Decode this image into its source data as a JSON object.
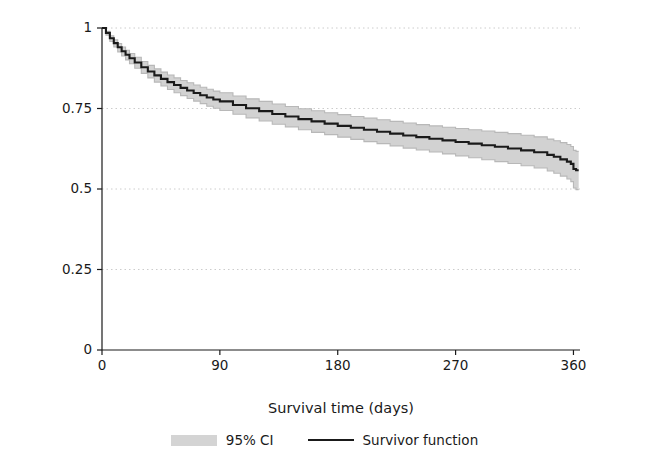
{
  "chart_data": {
    "type": "line",
    "title": "",
    "xlabel": "Survival time (days)",
    "ylabel": "Cumulative survival",
    "xlim": [
      0,
      365
    ],
    "ylim": [
      0,
      1
    ],
    "xticks": [
      0,
      90,
      180,
      270,
      360
    ],
    "yticks": [
      0,
      0.25,
      0.5,
      0.75,
      1
    ],
    "ytick_labels": [
      "0",
      "0.25",
      "0.5",
      "0.75",
      "1"
    ],
    "xtick_labels": [
      "0",
      "90",
      "180",
      "270",
      "360"
    ],
    "grid": "horizontal-dotted",
    "legend_position": "bottom-center",
    "legend": [
      {
        "label": "95% CI",
        "style": "band",
        "color": "#d4d4d4"
      },
      {
        "label": "Survivor function",
        "style": "line",
        "color": "#1a1a1a"
      }
    ],
    "series": [
      {
        "name": "Survivor function",
        "color": "#1a1a1a",
        "x": [
          0,
          3,
          6,
          9,
          12,
          15,
          18,
          21,
          25,
          30,
          35,
          40,
          45,
          50,
          55,
          60,
          65,
          70,
          75,
          80,
          85,
          90,
          100,
          110,
          120,
          130,
          140,
          150,
          160,
          170,
          180,
          190,
          200,
          210,
          220,
          230,
          240,
          250,
          260,
          270,
          280,
          290,
          300,
          310,
          320,
          330,
          340,
          345,
          350,
          355,
          358,
          360,
          362,
          364
        ],
        "y": [
          1.0,
          0.985,
          0.968,
          0.953,
          0.94,
          0.928,
          0.917,
          0.906,
          0.893,
          0.878,
          0.865,
          0.853,
          0.842,
          0.832,
          0.823,
          0.814,
          0.806,
          0.798,
          0.791,
          0.784,
          0.778,
          0.772,
          0.761,
          0.751,
          0.742,
          0.733,
          0.725,
          0.717,
          0.71,
          0.703,
          0.696,
          0.69,
          0.684,
          0.678,
          0.672,
          0.666,
          0.661,
          0.656,
          0.651,
          0.646,
          0.641,
          0.636,
          0.631,
          0.626,
          0.62,
          0.614,
          0.606,
          0.6,
          0.592,
          0.585,
          0.578,
          0.562,
          0.558,
          0.558
        ]
      },
      {
        "name": "95% CI upper",
        "color": "#c9c9c9",
        "x": [
          0,
          3,
          6,
          9,
          12,
          15,
          18,
          21,
          25,
          30,
          35,
          40,
          45,
          50,
          55,
          60,
          65,
          70,
          75,
          80,
          85,
          90,
          100,
          110,
          120,
          130,
          140,
          150,
          160,
          170,
          180,
          190,
          200,
          210,
          220,
          230,
          240,
          250,
          260,
          270,
          280,
          290,
          300,
          310,
          320,
          330,
          340,
          345,
          350,
          355,
          358,
          360,
          362,
          364
        ],
        "y": [
          1.0,
          0.99,
          0.976,
          0.963,
          0.952,
          0.941,
          0.931,
          0.921,
          0.909,
          0.896,
          0.884,
          0.873,
          0.863,
          0.854,
          0.845,
          0.837,
          0.83,
          0.823,
          0.816,
          0.81,
          0.804,
          0.799,
          0.789,
          0.78,
          0.772,
          0.764,
          0.756,
          0.749,
          0.743,
          0.737,
          0.731,
          0.725,
          0.72,
          0.715,
          0.71,
          0.705,
          0.7,
          0.696,
          0.692,
          0.688,
          0.684,
          0.68,
          0.676,
          0.672,
          0.667,
          0.662,
          0.655,
          0.65,
          0.644,
          0.638,
          0.632,
          0.62,
          0.617,
          0.617
        ]
      },
      {
        "name": "95% CI lower",
        "color": "#c9c9c9",
        "x": [
          0,
          3,
          6,
          9,
          12,
          15,
          18,
          21,
          25,
          30,
          35,
          40,
          45,
          50,
          55,
          60,
          65,
          70,
          75,
          80,
          85,
          90,
          100,
          110,
          120,
          130,
          140,
          150,
          160,
          170,
          180,
          190,
          200,
          210,
          220,
          230,
          240,
          250,
          260,
          270,
          280,
          290,
          300,
          310,
          320,
          330,
          340,
          345,
          350,
          355,
          358,
          360,
          362,
          364
        ],
        "y": [
          1.0,
          0.978,
          0.958,
          0.941,
          0.926,
          0.913,
          0.901,
          0.889,
          0.875,
          0.859,
          0.845,
          0.832,
          0.82,
          0.809,
          0.799,
          0.79,
          0.781,
          0.773,
          0.765,
          0.757,
          0.751,
          0.744,
          0.732,
          0.721,
          0.711,
          0.701,
          0.693,
          0.684,
          0.676,
          0.669,
          0.661,
          0.654,
          0.647,
          0.641,
          0.634,
          0.627,
          0.621,
          0.615,
          0.609,
          0.603,
          0.597,
          0.591,
          0.585,
          0.579,
          0.572,
          0.565,
          0.556,
          0.549,
          0.54,
          0.531,
          0.523,
          0.503,
          0.498,
          0.498
        ]
      }
    ]
  },
  "axes": {
    "y_title": "Cumulative survival",
    "x_title": "Survival time (days)"
  },
  "legend": {
    "ci_label": "95% CI",
    "survivor_label": "Survivor function"
  }
}
